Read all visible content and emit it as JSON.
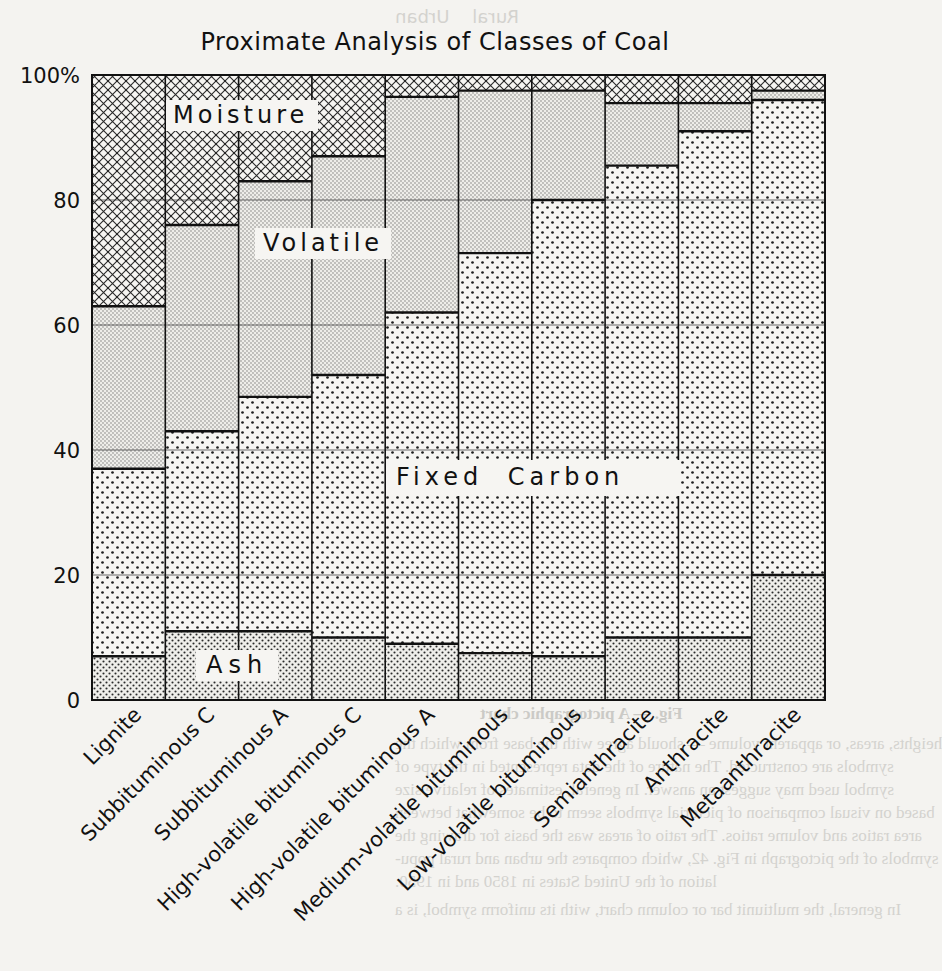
{
  "chart_data": {
    "type": "bar",
    "stacked": true,
    "percent": true,
    "title": "Proximate Analysis of Classes of Coal",
    "xlabel": "",
    "ylabel": "",
    "ylim": [
      0,
      100
    ],
    "yticks": [
      {
        "value": 0,
        "label": "0"
      },
      {
        "value": 20,
        "label": "20"
      },
      {
        "value": 40,
        "label": "40"
      },
      {
        "value": 60,
        "label": "60"
      },
      {
        "value": 80,
        "label": "80"
      },
      {
        "value": 100,
        "label": "100%"
      }
    ],
    "grid": true,
    "legend_position": "inline labels",
    "categories": [
      "Lignite",
      "Subbituminous C",
      "Subbituminous A",
      "High-volatile bituminous C",
      "High-volatile bituminous A",
      "Medium-volatile bituminous",
      "Low-volatile bituminous",
      "Semianthracite",
      "Anthracite",
      "Metaanthracite"
    ],
    "series": [
      {
        "name": "Ash",
        "pattern": "fine-dots-dense",
        "values": [
          7,
          11,
          11,
          10,
          9,
          7.5,
          7,
          10,
          10,
          20
        ]
      },
      {
        "name": "Fixed Carbon",
        "pattern": "coarse-dots",
        "values": [
          30,
          32,
          37.5,
          42,
          53,
          64,
          73,
          75.5,
          81,
          76
        ]
      },
      {
        "name": "Volatile",
        "pattern": "fine-stipple",
        "values": [
          26,
          33,
          34.5,
          35,
          34.5,
          26,
          17.5,
          10,
          4.5,
          1.5
        ]
      },
      {
        "name": "Moisture",
        "pattern": "crosshatch",
        "values": [
          37,
          24,
          17,
          13,
          3.5,
          2.5,
          2.5,
          4.5,
          4.5,
          2.5
        ]
      }
    ],
    "annotations": [
      {
        "text": "Moisture",
        "series": "Moisture"
      },
      {
        "text": "Volatile",
        "series": "Volatile"
      },
      {
        "text": "Fixed Carbon",
        "series": "Fixed Carbon"
      },
      {
        "text": "Ash",
        "series": "Ash"
      }
    ]
  },
  "labels": {
    "title": "Proximate Analysis of Classes of Coal",
    "moisture": "Moisture",
    "volatile": "Volatile",
    "fixed_carbon": "Fixed Carbon",
    "ash": "Ash"
  }
}
